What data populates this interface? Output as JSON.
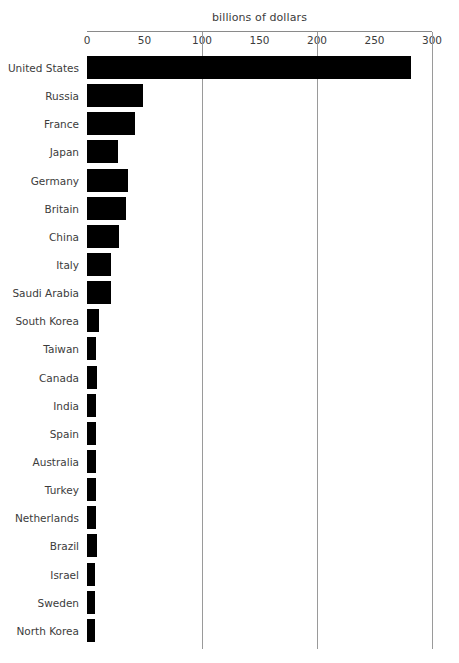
{
  "chart_data": {
    "type": "bar",
    "orientation": "horizontal",
    "title": "billions of dollars",
    "xlabel": "",
    "ylabel": "",
    "xlim": [
      0,
      300
    ],
    "xticks": [
      0,
      50,
      100,
      150,
      200,
      250,
      300
    ],
    "xtick_labels": [
      "0",
      "50",
      "100",
      "150",
      "200",
      "250",
      "300"
    ],
    "gridlines_at": [
      100,
      200,
      300
    ],
    "grid": true,
    "legend": false,
    "bar_color": "#000000",
    "axis_color": "#8a8a8a",
    "grid_color": "#9a9a9a",
    "text_color": "#3c3c3c",
    "categories": [
      "United States",
      "Russia",
      "France",
      "Japan",
      "Germany",
      "Britain",
      "China",
      "Italy",
      "Saudi Arabia",
      "South Korea",
      "Taiwan",
      "Canada",
      "India",
      "Spain",
      "Australia",
      "Turkey",
      "Netherlands",
      "Brazil",
      "Israel",
      "Sweden",
      "North Korea"
    ],
    "values": [
      282,
      49,
      42,
      27,
      36,
      34,
      28,
      21,
      21,
      10,
      8,
      9,
      8,
      8,
      8,
      8,
      8,
      9,
      7,
      7,
      7
    ]
  }
}
